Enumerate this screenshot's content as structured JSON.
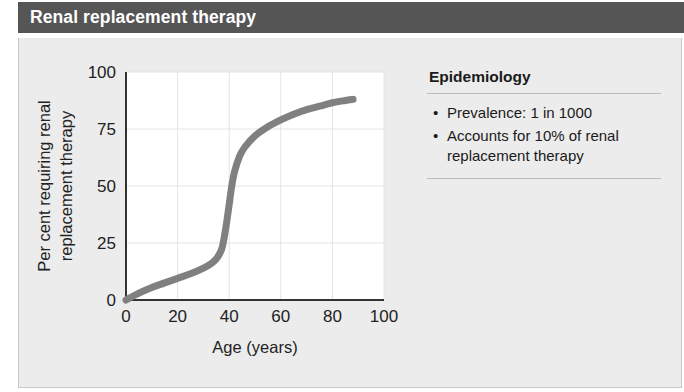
{
  "header": {
    "title": "Renal replacement therapy",
    "background_color": "#555556",
    "text_color": "#ffffff"
  },
  "panel": {
    "background_color": "#ececec",
    "border_color": "#c9c9c9"
  },
  "info": {
    "heading": "Epidemiology",
    "bullet_glyph": "•",
    "items": [
      "Prevalence: 1 in 1000",
      "Accounts for 10% of renal replacement therapy"
    ]
  },
  "chart_data": {
    "type": "line",
    "title": "",
    "xlabel": "Age (years)",
    "ylabel": "Per cent requiring renal replacement therapy",
    "ylabel_lines": [
      "Per cent requiring renal",
      "replacement therapy"
    ],
    "xlim": [
      0,
      100
    ],
    "ylim": [
      0,
      100
    ],
    "xticks": [
      0,
      20,
      40,
      60,
      80,
      100
    ],
    "yticks": [
      0,
      25,
      50,
      75,
      100
    ],
    "xtick_labels": [
      "0",
      "20",
      "40",
      "60",
      "80",
      "100"
    ],
    "ytick_labels": [
      "0",
      "25",
      "50",
      "75",
      "100"
    ],
    "grid": true,
    "grid_color": "#e4e4e4",
    "plot_background": "#ffffff",
    "axis_color": "#333333",
    "legend": null,
    "series": [
      {
        "name": "Per cent requiring renal replacement therapy",
        "color": "#808080",
        "line_width": 7,
        "x": [
          0,
          5,
          10,
          15,
          20,
          25,
          30,
          33,
          35,
          37,
          38,
          39,
          40,
          41,
          42,
          44,
          46,
          50,
          55,
          60,
          65,
          70,
          75,
          80,
          85,
          88
        ],
        "y": [
          0,
          3,
          5.5,
          7.5,
          9.5,
          11.5,
          14,
          16,
          18,
          22,
          27,
          34,
          42,
          50,
          56,
          63,
          67,
          72,
          76,
          79,
          81.5,
          83.5,
          85,
          86.5,
          87.5,
          88
        ]
      }
    ]
  }
}
